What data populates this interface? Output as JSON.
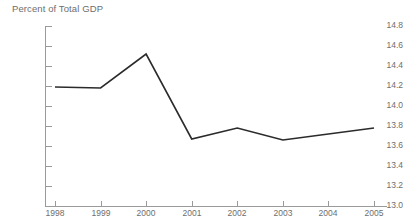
{
  "chart_data": {
    "type": "line",
    "title": "Percent of Total GDP",
    "xlabel": "",
    "ylabel": "",
    "categories": [
      "1998",
      "1999",
      "2000",
      "2001",
      "2002",
      "2003",
      "2004",
      "2005"
    ],
    "x": [
      1998,
      1999,
      2000,
      2001,
      2002,
      2003,
      2004,
      2005
    ],
    "values": [
      14.19,
      14.18,
      14.52,
      13.67,
      13.78,
      13.66,
      13.72,
      13.78
    ],
    "series": [
      {
        "name": "Percent of Total GDP",
        "values": [
          14.19,
          14.18,
          14.52,
          13.67,
          13.78,
          13.66,
          13.72,
          13.78
        ]
      }
    ],
    "ylim": [
      13.0,
      14.8
    ],
    "ytick_labels": [
      "14.8",
      "14.6",
      "14.4",
      "14.2",
      "14.0",
      "13.8",
      "13.6",
      "13.4",
      "13.2",
      "13.0"
    ],
    "ytick_values": [
      14.8,
      14.6,
      14.4,
      14.2,
      14.0,
      13.8,
      13.6,
      13.4,
      13.2,
      13.0
    ],
    "xtick_labels": [
      "1998",
      "1999",
      "2000",
      "2001",
      "2002",
      "2003",
      "2004",
      "2005"
    ],
    "grid": false,
    "legend": "none",
    "line_color": "#2b2b2b",
    "axis_color": "#9a9a9a",
    "label_color": "#6e6e6e",
    "background_color": "#ffffff"
  }
}
